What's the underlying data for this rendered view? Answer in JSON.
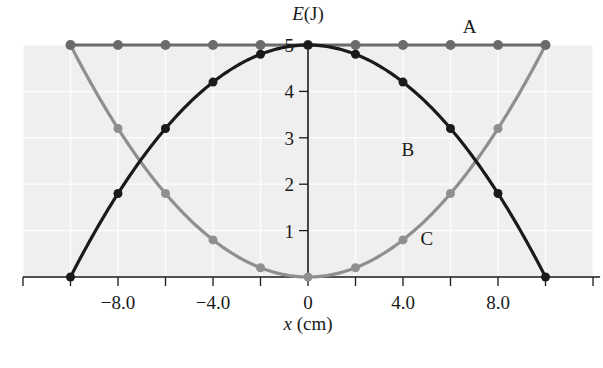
{
  "chart_data": {
    "type": "line",
    "title": "",
    "xlabel": "x (cm)",
    "ylabel": "E(J)",
    "xlim": [
      -12,
      12
    ],
    "ylim": [
      0,
      5
    ],
    "x_ticks": [
      -12,
      -10,
      -8,
      -6,
      -4,
      -2,
      0,
      2,
      4,
      6,
      8,
      10,
      12
    ],
    "x_tick_labels": [
      {
        "x": -8,
        "label": "−8.0"
      },
      {
        "x": -4,
        "label": "−4.0"
      },
      {
        "x": 0,
        "label": "0"
      },
      {
        "x": 4,
        "label": "4.0"
      },
      {
        "x": 8,
        "label": "8.0"
      }
    ],
    "y_ticks": [
      1,
      2,
      3,
      4,
      5
    ],
    "y_tick_labels": [
      "1",
      "2",
      "3",
      "4",
      "5"
    ],
    "grid": true,
    "x": [
      -10,
      -8,
      -6,
      -4,
      -2,
      0,
      2,
      4,
      6,
      8,
      10
    ],
    "series": [
      {
        "name": "A",
        "label": "A",
        "color": "#6b6b6b",
        "values": [
          5.0,
          5.0,
          5.0,
          5.0,
          5.0,
          5.0,
          5.0,
          5.0,
          5.0,
          5.0,
          5.0
        ]
      },
      {
        "name": "B",
        "label": "B",
        "color": "#1a1a1a",
        "values": [
          0.0,
          1.8,
          3.2,
          4.2,
          4.8,
          5.0,
          4.8,
          4.2,
          3.2,
          1.8,
          0.0
        ]
      },
      {
        "name": "C",
        "label": "C",
        "color": "#8f8f8f",
        "values": [
          5.0,
          3.2,
          1.8,
          0.8,
          0.2,
          0.0,
          0.2,
          0.8,
          1.8,
          3.2,
          5.0
        ]
      }
    ],
    "annotations": [
      {
        "text": "A",
        "x": 6.8,
        "y": 5.25
      },
      {
        "text": "B",
        "x": 4.2,
        "y": 2.6
      },
      {
        "text": "C",
        "x": 5.0,
        "y": 0.7
      }
    ]
  },
  "labels": {
    "y_axis_italic": "E",
    "y_axis_unit": "(J)",
    "x_axis_italic": "x",
    "x_axis_unit": " (cm)"
  }
}
